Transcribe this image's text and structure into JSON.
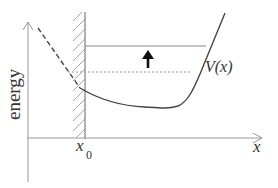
{
  "diagram": {
    "type": "potential-energy-well",
    "y_axis_label": "energy",
    "x_axis_label": "x",
    "wall_label": "x",
    "wall_label_subscript": "0",
    "curve_label": "V(x)",
    "elements": {
      "wall": "hard wall at x0 (hatched region to the left)",
      "dashed_curve": "extension of potential to the left of the wall",
      "solid_curve": "potential V(x)",
      "upper_level": "solid horizontal energy level",
      "lower_level": "dotted horizontal energy level",
      "arrow": "upward arrow indicating raising of energy level"
    },
    "colors": {
      "axis": "#999999",
      "curve": "#444444",
      "hatch": "#aaaaaa",
      "level_line": "#888888",
      "dotted_line": "#999999",
      "arrow": "#111111",
      "text": "#333333"
    }
  }
}
